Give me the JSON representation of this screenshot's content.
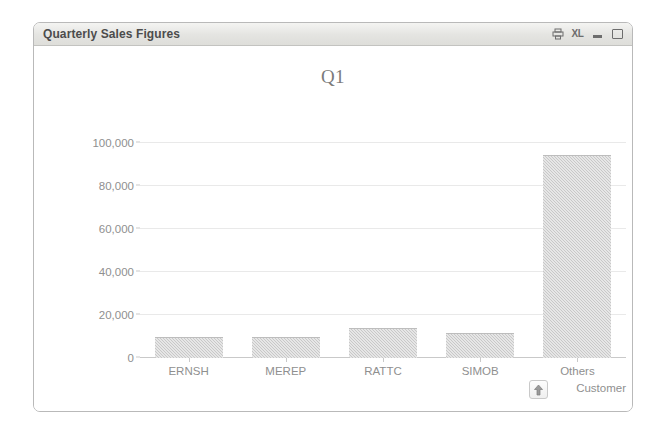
{
  "window": {
    "title": "Quarterly Sales Figures",
    "controls": [
      {
        "name": "print-icon",
        "label": ""
      },
      {
        "name": "export-excel-icon",
        "label": "XL"
      },
      {
        "name": "minimize-button",
        "label": ""
      },
      {
        "name": "maximize-button",
        "label": ""
      }
    ]
  },
  "colors": {
    "bar_fill": "#c8c8c8",
    "grid": "#e9e9e9",
    "axis": "#c9c9c9",
    "text": "#8f8f8f",
    "title_text": "#4c4c4c",
    "chart_title_text": "#7b7b7b",
    "titlebar_bg": "#e4e4e1",
    "window_border": "#b9b9b9"
  },
  "toolbar": {
    "drill_up_icon": "up-arrow-icon"
  },
  "chart_data": {
    "type": "bar",
    "title": "Q1",
    "xlabel": "Customer",
    "ylabel": "",
    "categories": [
      "ERNSH",
      "MEREP",
      "RATTC",
      "SIMOB",
      "Others"
    ],
    "values": [
      9800,
      9800,
      14000,
      11600,
      94500
    ],
    "series": [
      {
        "name": "Q1",
        "values": [
          9800,
          9800,
          14000,
          11600,
          94500
        ]
      }
    ],
    "ylim": [
      0,
      100000
    ],
    "yticks": [
      0,
      20000,
      40000,
      60000,
      80000,
      100000
    ],
    "ytick_labels": [
      "0",
      "20,000",
      "40,000",
      "60,000",
      "80,000",
      "100,000"
    ],
    "grid": true,
    "legend": false,
    "legend_position": "none"
  }
}
